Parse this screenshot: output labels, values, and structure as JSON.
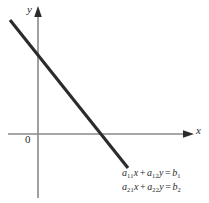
{
  "figure": {
    "background_color": "#ffffff",
    "axes": {
      "x_axis_label": "x",
      "y_axis_label": "y",
      "origin_label": "0",
      "axis_color": "#8a8a8a",
      "arrow_color": "#2b2b2b"
    },
    "line": {
      "name": "coincident-line",
      "color": "#2b2b2b",
      "width_px": 3,
      "start": {
        "x": 10,
        "y": 20
      },
      "end": {
        "x": 128,
        "y": 168
      },
      "y_intercept_px": 58,
      "x_intercept_px": 102
    },
    "annotations": {
      "equation_1": {
        "coefficient_1": "a",
        "coefficient_1_sub": "11",
        "variable_1": "x",
        "operator": "+",
        "coefficient_2": "a",
        "coefficient_2_sub": "12",
        "variable_2": "y",
        "equals": "=",
        "rhs": "b",
        "rhs_sub": "1",
        "plain": "a11x + a12y = b1"
      },
      "equation_2": {
        "coefficient_1": "a",
        "coefficient_1_sub": "21",
        "variable_1": "x",
        "operator": "+",
        "coefficient_2": "a",
        "coefficient_2_sub": "22",
        "variable_2": "y",
        "equals": "=",
        "rhs": "b",
        "rhs_sub": "2",
        "plain": "a21x + a22y = b2"
      }
    }
  }
}
